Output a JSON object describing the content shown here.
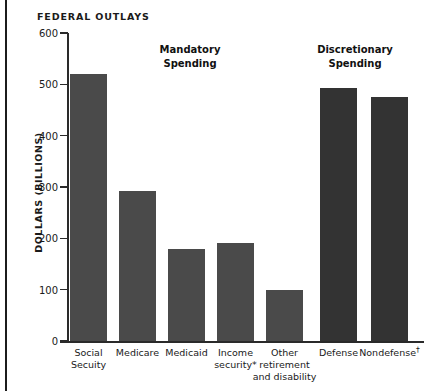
{
  "chart_data": {
    "type": "bar",
    "title": "FEDERAL OUTLAYS",
    "xlabel": "",
    "ylabel": "DOLLARS (BILLIONS)",
    "ylim": [
      0,
      600
    ],
    "ytick_values": [
      0,
      100,
      200,
      300,
      400,
      500,
      600
    ],
    "ytick_labels": [
      "0",
      "100",
      "200",
      "300",
      "400",
      "500",
      "600"
    ],
    "grid": false,
    "legend": "none",
    "categories": [
      "Social Secuity",
      "Medicare",
      "Medicaid",
      "Income security*",
      "Other retirement and disability",
      "Defense",
      "Nondefense†"
    ],
    "values": [
      520,
      292,
      179,
      190,
      99,
      493,
      475
    ],
    "groups": [
      {
        "name": "Mandatory Spending",
        "categories": [
          "Social Secuity",
          "Medicare",
          "Medicaid",
          "Income security*",
          "Other retirement and disability"
        ]
      },
      {
        "name": "Discretionary Spending",
        "categories": [
          "Defense",
          "Nondefense†"
        ]
      }
    ],
    "annotations": [
      {
        "text": "Mandatory\nSpending"
      },
      {
        "text": "Discretionary\nSpending"
      }
    ],
    "colors": {
      "mandatory_bar": "#4a4a4a",
      "discretionary_bar": "#333333",
      "axis": "#2a2a2a",
      "text": "#1a1a1a",
      "background": "#ffffff"
    }
  },
  "chart": {
    "title": "FEDERAL OUTLAYS",
    "y_axis_title": "DOLLARS (BILLIONS)",
    "ticks": [
      {
        "label": "600"
      },
      {
        "label": "500"
      },
      {
        "label": "400"
      },
      {
        "label": "300"
      },
      {
        "label": "200"
      },
      {
        "label": "100"
      },
      {
        "label": "0"
      }
    ],
    "group_headings": [
      {
        "line1": "Mandatory",
        "line2": "Spending"
      },
      {
        "line1": "Discretionary",
        "line2": "Spending"
      }
    ],
    "bars": [
      {
        "label_line1": "Social",
        "label_line2": "Secuity",
        "label_line3": "",
        "value": 520
      },
      {
        "label_line1": "Medicare",
        "label_line2": "",
        "label_line3": "",
        "value": 292
      },
      {
        "label_line1": "Medicaid",
        "label_line2": "",
        "label_line3": "",
        "value": 179
      },
      {
        "label_line1": "Income",
        "label_line2": "security*",
        "label_line3": "",
        "value": 190
      },
      {
        "label_line1": "Other",
        "label_line2": "retirement",
        "label_line3": "and disability",
        "value": 99
      },
      {
        "label_line1": "Defense",
        "label_line2": "",
        "label_line3": "",
        "value": 493
      },
      {
        "label_line1": "Nondefense",
        "label_line2": "",
        "label_line3": "",
        "value": 475,
        "superscript": "†"
      }
    ]
  }
}
